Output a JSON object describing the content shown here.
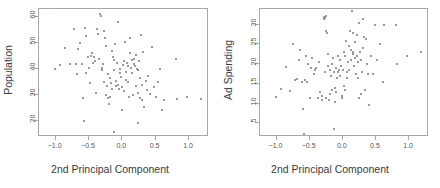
{
  "figure": {
    "background": "#ffffff",
    "point_color": "#7a7a7a",
    "axis_color": "#a8a8a8",
    "text_color": "#3b3b3b"
  },
  "chart_data": [
    {
      "type": "scatter",
      "title": "",
      "xlabel": "2nd Principal Component",
      "ylabel": "Population",
      "xlim": [
        -1.25,
        1.3
      ],
      "ylim": [
        14,
        63
      ],
      "xticks": [
        -1.0,
        -0.5,
        0.0,
        0.5,
        1.0
      ],
      "xticklabels": [
        "−1.0",
        "−0.5",
        "0.0",
        "0.5",
        "1.0"
      ],
      "yticks": [
        20,
        30,
        40,
        50,
        60
      ],
      "yticklabels": [
        "20",
        "30",
        "40",
        "50",
        "60"
      ],
      "grid": false,
      "legend": null,
      "x": [
        -1.01,
        -0.93,
        -0.86,
        -0.78,
        -0.72,
        -0.7,
        -0.68,
        -0.66,
        -0.63,
        -0.61,
        -0.59,
        -0.57,
        -0.55,
        -0.54,
        -0.52,
        -0.5,
        -0.48,
        -0.47,
        -0.45,
        -0.44,
        -0.42,
        -0.41,
        -0.39,
        -0.38,
        -0.36,
        -0.35,
        -0.33,
        -0.32,
        -0.31,
        -0.3,
        -0.29,
        -0.28,
        -0.27,
        -0.26,
        -0.25,
        -0.24,
        -0.23,
        -0.22,
        -0.21,
        -0.2,
        -0.19,
        -0.18,
        -0.17,
        -0.16,
        -0.15,
        -0.14,
        -0.13,
        -0.12,
        -0.11,
        -0.1,
        -0.09,
        -0.08,
        -0.07,
        -0.06,
        -0.05,
        -0.04,
        -0.03,
        -0.02,
        -0.01,
        0.0,
        0.01,
        0.02,
        0.03,
        0.04,
        0.05,
        0.06,
        0.07,
        0.08,
        0.09,
        0.1,
        0.11,
        0.12,
        0.13,
        0.14,
        0.15,
        0.16,
        0.17,
        0.18,
        0.19,
        0.2,
        0.21,
        0.22,
        0.23,
        0.24,
        0.25,
        0.26,
        0.27,
        0.28,
        0.29,
        0.3,
        0.31,
        0.33,
        0.35,
        0.37,
        0.39,
        0.41,
        0.44,
        0.47,
        0.5,
        0.54,
        0.57,
        0.6,
        0.62,
        0.8,
        0.82,
        0.97,
        1.18,
        -0.56,
        -0.13,
        0.23
      ],
      "y": [
        40.0,
        41.5,
        48.2,
        41.8,
        55.5,
        41.8,
        38.0,
        47.8,
        50.0,
        42.0,
        28.8,
        20.0,
        38.5,
        52.5,
        44.5,
        40.5,
        34.5,
        45.0,
        46.0,
        42.5,
        44.8,
        43.0,
        31.0,
        55.2,
        53.5,
        44.0,
        61.0,
        60.5,
        39.8,
        40.5,
        42.0,
        35.0,
        54.5,
        52.0,
        30.0,
        49.0,
        33.5,
        29.0,
        38.0,
        26.5,
        36.5,
        29.5,
        34.5,
        32.5,
        47.0,
        44.5,
        43.5,
        39.5,
        49.5,
        35.5,
        33.5,
        42.5,
        34.0,
        58.0,
        32.5,
        38.5,
        40.0,
        37.0,
        24.5,
        33.0,
        41.5,
        43.0,
        31.5,
        50.5,
        39.0,
        36.0,
        42.5,
        41.0,
        35.0,
        29.5,
        52.0,
        46.0,
        40.5,
        43.5,
        38.5,
        30.0,
        44.0,
        42.0,
        41.0,
        33.5,
        45.5,
        40.0,
        39.5,
        31.0,
        43.0,
        36.5,
        29.0,
        53.0,
        34.0,
        28.0,
        46.5,
        25.5,
        35.5,
        32.0,
        37.5,
        30.5,
        48.5,
        33.0,
        29.5,
        35.0,
        40.0,
        24.5,
        28.0,
        44.0,
        28.5,
        29.5,
        28.5,
        55.8,
        16.0,
        19.5
      ]
    },
    {
      "type": "scatter",
      "title": "",
      "xlabel": "2nd Principal Component",
      "ylabel": "Ad Spending",
      "xlim": [
        -1.25,
        1.3
      ],
      "ylim": [
        1.5,
        34
      ],
      "xticks": [
        -1.0,
        -0.5,
        0.0,
        0.5,
        1.0
      ],
      "xticklabels": [
        "−1.0",
        "−0.5",
        "0.0",
        "0.5",
        "1.0"
      ],
      "yticks": [
        5,
        10,
        15,
        20,
        25,
        30
      ],
      "yticklabels": [
        "5",
        "10",
        "15",
        "20",
        "25",
        "30"
      ],
      "grid": false,
      "legend": null,
      "x": [
        -1.01,
        -0.93,
        -0.86,
        -0.8,
        -0.75,
        -0.72,
        -0.69,
        -0.66,
        -0.64,
        -0.62,
        -0.6,
        -0.58,
        -0.56,
        -0.54,
        -0.52,
        -0.5,
        -0.48,
        -0.46,
        -0.44,
        -0.42,
        -0.4,
        -0.38,
        -0.36,
        -0.34,
        -0.32,
        -0.31,
        -0.29,
        -0.28,
        -0.27,
        -0.26,
        -0.25,
        -0.24,
        -0.23,
        -0.22,
        -0.21,
        -0.2,
        -0.19,
        -0.18,
        -0.17,
        -0.16,
        -0.15,
        -0.14,
        -0.13,
        -0.12,
        -0.11,
        -0.1,
        -0.09,
        -0.08,
        -0.07,
        -0.06,
        -0.05,
        -0.04,
        -0.03,
        -0.02,
        -0.01,
        0.0,
        0.01,
        0.02,
        0.03,
        0.04,
        0.05,
        0.06,
        0.07,
        0.08,
        0.09,
        0.1,
        0.11,
        0.12,
        0.13,
        0.14,
        0.15,
        0.16,
        0.17,
        0.18,
        0.19,
        0.2,
        0.21,
        0.22,
        0.23,
        0.24,
        0.25,
        0.26,
        0.27,
        0.28,
        0.29,
        0.3,
        0.31,
        0.32,
        0.34,
        0.36,
        0.38,
        0.4,
        0.43,
        0.46,
        0.49,
        0.52,
        0.56,
        0.6,
        0.62,
        0.8,
        0.82,
        0.97,
        1.18,
        -0.57,
        -0.12,
        0.15,
        0.23,
        -0.27,
        -0.26,
        0.35
      ],
      "y": [
        11.7,
        13.8,
        19.3,
        13.2,
        25.0,
        16.0,
        16.2,
        21.0,
        23.5,
        15.5,
        8.7,
        2.3,
        22.0,
        15.5,
        20.0,
        11.5,
        19.0,
        21.5,
        17.5,
        18.5,
        19.0,
        11.5,
        20.5,
        13.0,
        12.0,
        11.0,
        32.0,
        31.5,
        18.0,
        11.5,
        28.5,
        28.0,
        22.5,
        19.5,
        11.0,
        12.5,
        18.5,
        17.0,
        13.5,
        20.0,
        21.5,
        18.0,
        3.5,
        14.0,
        19.0,
        13.0,
        16.5,
        18.0,
        22.0,
        18.5,
        17.0,
        21.0,
        19.5,
        11.5,
        12.0,
        18.5,
        23.0,
        14.5,
        13.5,
        22.0,
        26.0,
        18.0,
        16.5,
        20.5,
        24.5,
        18.5,
        28.5,
        21.0,
        23.5,
        33.5,
        22.5,
        23.0,
        19.5,
        21.5,
        25.5,
        17.5,
        27.5,
        22.0,
        20.5,
        11.5,
        30.5,
        23.0,
        21.0,
        12.5,
        18.0,
        31.5,
        24.0,
        27.0,
        13.5,
        20.0,
        17.5,
        9.5,
        22.0,
        17.5,
        30.0,
        21.0,
        25.0,
        15.5,
        30.0,
        30.0,
        20.0,
        22.0,
        23.0,
        16.0,
        10.5,
        28.0,
        16.5,
        31.8,
        32.2,
        26.5
      ]
    }
  ]
}
